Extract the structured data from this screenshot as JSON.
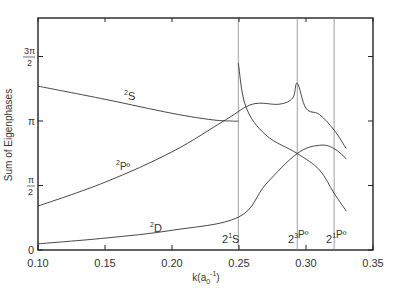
{
  "chart_data": {
    "type": "line",
    "title": "",
    "xlabel": "k(a0^-1)",
    "xlabel_parts": {
      "main": "k(a",
      "sub": "0",
      "sup": "-1",
      "close": ")"
    },
    "ylabel": "Sum of Eigenphases",
    "xlim": [
      0.1,
      0.35
    ],
    "ylim_label": [
      "0",
      "π/2",
      "π",
      "3π/2"
    ],
    "x_ticks": [
      "0.10",
      "0.15",
      "0.20",
      "0.25",
      "0.30",
      "0.35"
    ],
    "y_ticks": [
      {
        "value": 0,
        "label": "0"
      },
      {
        "value": 1.5708,
        "label_num": "π",
        "label_den": "2"
      },
      {
        "value": 3.1416,
        "label": "π"
      },
      {
        "value": 4.7124,
        "label_num": "3π",
        "label_den": "2"
      }
    ],
    "grid": false,
    "legend": "none (curves labeled inline)",
    "thresholds": [
      {
        "x": 0.2495,
        "label_base": "2",
        "label_sup": "1",
        "label_term": "S"
      },
      {
        "x": 0.2935,
        "label_base": "2",
        "label_sup": "3",
        "label_term": "Pº"
      },
      {
        "x": 0.321,
        "label_base": "2",
        "label_sup": "1",
        "label_term": "Pº"
      }
    ],
    "series": [
      {
        "name": "2S",
        "label_sup": "2",
        "label_term": "S",
        "x": [
          0.1,
          0.15,
          0.2,
          0.23,
          0.245,
          0.2495
        ],
        "y": [
          3.99,
          3.67,
          3.33,
          3.17,
          3.14,
          3.14
        ]
      },
      {
        "name": "2Pº",
        "label_sup": "2",
        "label_term": "Pº",
        "x": [
          0.1,
          0.15,
          0.2,
          0.24,
          0.26,
          0.28,
          0.29,
          0.2935,
          0.3,
          0.31,
          0.321,
          0.33
        ],
        "y": [
          1.07,
          1.65,
          2.39,
          3.17,
          3.55,
          3.55,
          3.7,
          4.06,
          3.45,
          3.3,
          2.92,
          2.47
        ]
      },
      {
        "name": "2D",
        "label_sup": "2",
        "label_term": "D",
        "x": [
          0.1,
          0.15,
          0.2,
          0.2495,
          0.27,
          0.2935,
          0.31,
          0.321,
          0.33
        ],
        "y": [
          0.15,
          0.29,
          0.48,
          0.8,
          1.6,
          2.35,
          2.55,
          2.47,
          2.22
        ]
      },
      {
        "name": "unlabeled (from 2¹S cusp)",
        "x": [
          0.2495,
          0.255,
          0.27,
          0.2935,
          0.31,
          0.321,
          0.33
        ],
        "y": [
          4.55,
          3.5,
          2.8,
          2.35,
          1.95,
          1.38,
          0.95
        ]
      }
    ]
  }
}
